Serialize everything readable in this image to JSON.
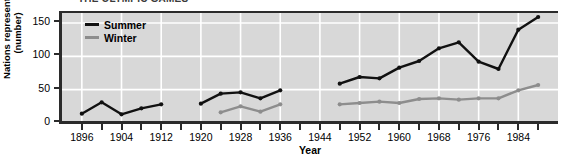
{
  "chart_data": {
    "type": "line",
    "title": "THE OLYMPIC GAMES",
    "xlabel": "Year",
    "ylabel_line1": "Nations represented",
    "ylabel_line2": "(number)",
    "xlim": [
      1892,
      1992
    ],
    "ylim": [
      0,
      165
    ],
    "yticks": [
      0,
      50,
      100,
      150
    ],
    "ytick_labels": [
      "0",
      "50",
      "100",
      "150"
    ],
    "xticks": [
      1896,
      1904,
      1912,
      1920,
      1928,
      1936,
      1944,
      1952,
      1960,
      1968,
      1976,
      1984
    ],
    "xtick_labels": [
      "1896",
      "1904",
      "1912",
      "1920",
      "1928",
      "1936",
      "1944",
      "1952",
      "1960",
      "1968",
      "1976",
      "1984"
    ],
    "grid": true,
    "grid_color": "#ffffff",
    "plot_background": "#d8d8d8",
    "legend_position": "upper left",
    "series": [
      {
        "name": "Summer",
        "color": "#111111",
        "x": [
          1896,
          1900,
          1904,
          1908,
          1912,
          1920,
          1924,
          1928,
          1932,
          1936,
          1948,
          1952,
          1956,
          1960,
          1964,
          1968,
          1972,
          1976,
          1980,
          1984,
          1988
        ],
        "values": [
          14,
          31,
          13,
          22,
          28,
          29,
          44,
          46,
          37,
          49,
          59,
          69,
          67,
          83,
          93,
          112,
          121,
          92,
          81,
          140,
          159
        ]
      },
      {
        "name": "Winter",
        "color": "#8d8d8d",
        "x": [
          1924,
          1928,
          1932,
          1936,
          1948,
          1952,
          1956,
          1960,
          1964,
          1968,
          1972,
          1976,
          1980,
          1984,
          1988
        ],
        "values": [
          16,
          25,
          17,
          28,
          28,
          30,
          32,
          30,
          36,
          37,
          35,
          37,
          37,
          49,
          57
        ]
      }
    ],
    "legend": [
      {
        "label": "Summer",
        "color": "#111111"
      },
      {
        "label": "Winter",
        "color": "#8d8d8d"
      }
    ]
  }
}
